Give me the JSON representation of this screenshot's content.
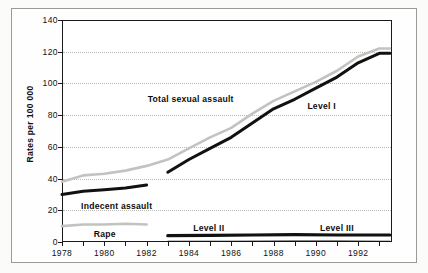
{
  "chart_data": {
    "type": "line",
    "title": "",
    "subtitle": "",
    "xlabel": "",
    "ylabel": "Rates per 100 000",
    "xlim": [
      1978,
      1993.6
    ],
    "ylim": [
      0,
      140
    ],
    "grid": true,
    "legend_position": "inline-annotations",
    "x_ticks": [
      "1978",
      "1980",
      "1982",
      "1984",
      "1986",
      "1988",
      "1990",
      "1992"
    ],
    "x_tick_values": [
      1978,
      1980,
      1982,
      1984,
      1986,
      1988,
      1990,
      1992
    ],
    "x_minor_tick_values": [
      1979,
      1981,
      1983,
      1985,
      1987,
      1989,
      1991,
      1993
    ],
    "y_ticks": [
      "0",
      "20",
      "40",
      "60",
      "80",
      "100",
      "120",
      "140"
    ],
    "y_tick_values": [
      0,
      20,
      40,
      60,
      80,
      100,
      120,
      140
    ],
    "series": [
      {
        "name": "Total sexual assault",
        "color": "#c2c2bf",
        "style": "gray",
        "width": 2.6,
        "label_x": 1982.05,
        "label_y": 90,
        "x": [
          1978,
          1979,
          1980,
          1981,
          1982,
          1983,
          1984,
          1985,
          1986,
          1987,
          1988,
          1989,
          1990,
          1991,
          1992,
          1993,
          1993.5
        ],
        "y": [
          38,
          42,
          43,
          45,
          48,
          52,
          59,
          66,
          72,
          81,
          89,
          95,
          101,
          108,
          117,
          122,
          122
        ]
      },
      {
        "name": "Level I",
        "color": "#111111",
        "style": "dark",
        "width": 3.0,
        "label_x": 1989.6,
        "label_y": 86,
        "x": [
          1983,
          1984,
          1985,
          1986,
          1987,
          1988,
          1989,
          1990,
          1991,
          1992,
          1993,
          1993.5
        ],
        "y": [
          44,
          52,
          59,
          66,
          75,
          84,
          90,
          97,
          104,
          113,
          119,
          119
        ]
      },
      {
        "name": "Indecent assault",
        "color": "#111111",
        "style": "dark",
        "width": 3.0,
        "label_x": 1978.9,
        "label_y": 23,
        "x": [
          1978,
          1979,
          1980,
          1981,
          1982
        ],
        "y": [
          30,
          32,
          33,
          34,
          36
        ]
      },
      {
        "name": "Rape",
        "color": "#c2c2bf",
        "style": "gray",
        "width": 2.6,
        "label_x": 1979.5,
        "label_y": 5,
        "x": [
          1978,
          1979,
          1980,
          1981,
          1982
        ],
        "y": [
          10,
          11,
          11,
          11.5,
          11
        ]
      },
      {
        "name": "Level II",
        "color": "#111111",
        "style": "dark",
        "width": 3.2,
        "label_x": 1984.2,
        "label_y": 9,
        "x": [
          1983,
          1985,
          1987,
          1989,
          1991,
          1993,
          1993.5
        ],
        "y": [
          4,
          4.2,
          4.4,
          4.6,
          4.4,
          4.4,
          4.4
        ]
      },
      {
        "name": "Level III",
        "color": "#111111",
        "style": "dark",
        "width": 1.4,
        "label_x": 1990.2,
        "label_y": 9,
        "x": [
          1983,
          1986,
          1989,
          1991,
          1993,
          1993.5
        ],
        "y": [
          0.4,
          0.4,
          0.5,
          0.5,
          0.4,
          0.4
        ]
      }
    ]
  }
}
